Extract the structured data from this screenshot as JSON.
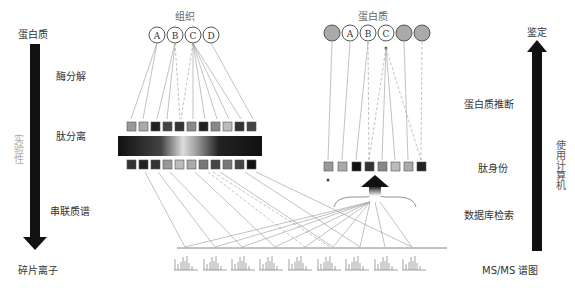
{
  "left_axis": {
    "top_label": "蛋白质",
    "bottom_label": "碎片离子",
    "side_label": "实验性",
    "steps": [
      "酶分解",
      "肽分离",
      "串联质谱"
    ]
  },
  "right_axis": {
    "top_label": "鉴定",
    "bottom_label": "MS/MS 谱图",
    "side_label": "使用计算机",
    "steps": [
      "蛋白质推断",
      "肽身份",
      "数据库检索"
    ]
  },
  "tissue_group": {
    "title": "组织",
    "circles": [
      "A",
      "B",
      "C",
      "D"
    ]
  },
  "protein_group": {
    "title": "蛋白质",
    "circles": [
      "",
      "A",
      "B",
      "C",
      "",
      ""
    ]
  },
  "colors": {
    "arrow": "#111111",
    "line": "#999999",
    "filled_circle": "#aaaaaa"
  },
  "peptide_row_top": [
    "#999",
    "#aaa",
    "#222",
    "#444",
    "#333",
    "#888",
    "#222",
    "#888",
    "#bbb",
    "#333",
    "#444"
  ],
  "peptide_row_bottom": [
    "#333",
    "#222",
    "#333",
    "#999",
    "#bbb",
    "#aaa",
    "#777",
    "#444",
    "#777",
    "#444",
    "#111"
  ],
  "peptide_id_row": [
    "#999",
    "#aaa",
    "#111",
    "#333",
    "#888",
    "#bbb",
    "#aaa",
    "#222"
  ],
  "spectra_count": 9
}
